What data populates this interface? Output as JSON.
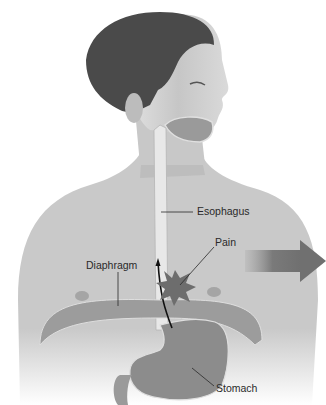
{
  "figure": {
    "labels": {
      "esophagus": "Esophagus",
      "pain": "Pain",
      "diaphragm": "Diaphragm",
      "stomach": "Stomach"
    },
    "colors": {
      "background": "#ffffff",
      "skin": "#cfcfcf",
      "skin_shadow": "#a9a9a9",
      "hair": "#4a4a4a",
      "esophagus": "#e6e6e6",
      "organ": "#8f8f8f",
      "organ_outline": "#dedede",
      "arrow": "#7a7a7a",
      "label_text": "#2a2a2a",
      "leader_line": "#2a2a2a"
    }
  }
}
